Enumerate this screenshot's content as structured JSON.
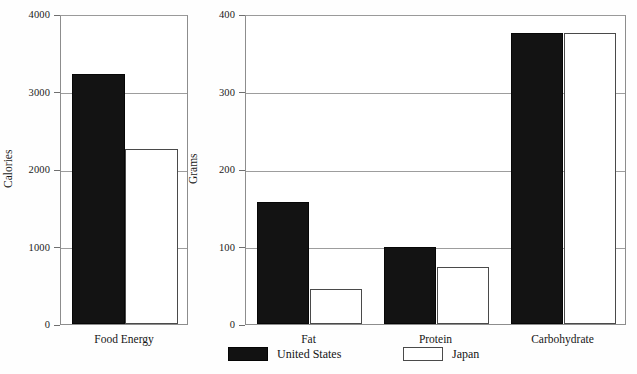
{
  "figure": {
    "width": 637,
    "height": 374,
    "background": "#fefefe",
    "bar_fill_us": "#131313",
    "bar_fill_japan": "#ffffff",
    "bar_stroke_japan": "#4a4a4a",
    "gridline_color": "#9d9d9d"
  },
  "legend": {
    "position": "bottom-center",
    "entries": [
      {
        "label": "United States",
        "style": "filled-black"
      },
      {
        "label": "Japan",
        "style": "open-white"
      }
    ]
  },
  "chart_data": [
    {
      "id": "food-energy",
      "type": "bar",
      "title": "",
      "xlabel": "",
      "ylabel": "Calories",
      "categories": [
        "Food Energy"
      ],
      "ylim": [
        0,
        4000
      ],
      "yticks": [
        0,
        1000,
        2000,
        3000,
        4000
      ],
      "ytick_labels": [
        "0",
        "1000",
        "2000",
        "3000",
        "4000"
      ],
      "grid": true,
      "legend_position": "bottom",
      "series": [
        {
          "name": "United States",
          "values": [
            3230
          ]
        },
        {
          "name": "Japan",
          "values": [
            2260
          ]
        }
      ]
    },
    {
      "id": "macronutrients",
      "type": "bar",
      "title": "",
      "xlabel": "",
      "ylabel": "Grams",
      "categories": [
        "Fat",
        "Protein",
        "Carbohydrate"
      ],
      "ylim": [
        0,
        400
      ],
      "yticks": [
        0,
        100,
        200,
        300,
        400
      ],
      "ytick_labels": [
        "0",
        "100",
        "200",
        "300",
        "400"
      ],
      "grid": true,
      "legend_position": "bottom",
      "series": [
        {
          "name": "United States",
          "values": [
            158,
            100,
            375
          ]
        },
        {
          "name": "Japan",
          "values": [
            45,
            73,
            375
          ]
        }
      ]
    }
  ]
}
